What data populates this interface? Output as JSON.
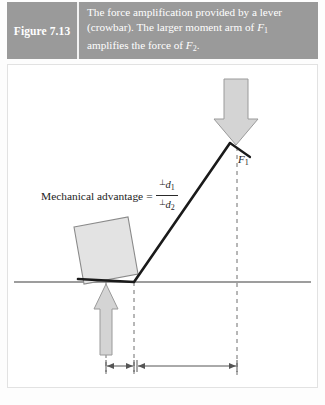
{
  "header": {
    "figure_number": "Figure 7.13",
    "caption_line_1": "The force amplification provided by a lever",
    "caption_line_2_a": "(crowbar). The larger moment arm of ",
    "caption_line_2_f": "F",
    "caption_line_2_sub": "1",
    "caption_line_3_a": "amplifies the force of ",
    "caption_line_3_f": "F",
    "caption_line_3_sub": "2",
    "caption_line_3_end": ".",
    "background_color": "#9a9a9a",
    "text_color": "#ffffff"
  },
  "formula": {
    "label": "Mechanical advantage",
    "equals": "=",
    "numerator_perp": "⊥",
    "numerator_var": "d",
    "numerator_sub": "1",
    "denominator_perp": "⊥",
    "denominator_var": "d",
    "denominator_sub": "2"
  },
  "diagram": {
    "force_top": {
      "name": "F",
      "subscript": "1",
      "direction": "down",
      "color": "#d4d4d4"
    },
    "force_bottom": {
      "name": "F",
      "subscript": "2",
      "direction": "up",
      "color": "#d4d4d4"
    },
    "moment_arm_long": {
      "perp": "⊥",
      "var": "d",
      "sub": "1"
    },
    "moment_arm_short": {
      "perp": "⊥",
      "var": "d",
      "sub": "2"
    },
    "block_color": "#e3e3e3",
    "lever_color": "#1a1a1a",
    "ground_color": "#7d7d7d",
    "dashed_color": "#6e6e6e",
    "panel_background": "#ffffff"
  }
}
